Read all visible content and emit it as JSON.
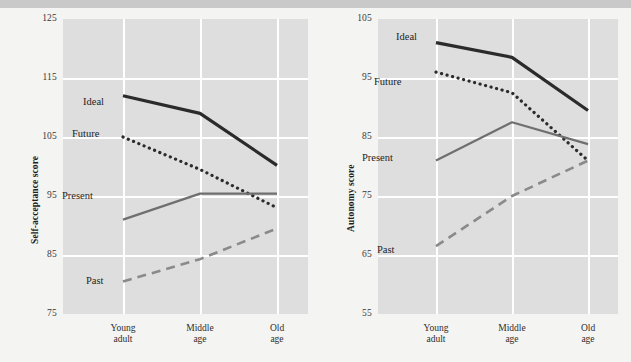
{
  "figure": {
    "background_color": "#f4f4f2",
    "plot_background_color": "#dedede",
    "gridline_color": "#ffffff",
    "line_color": "#2b2b2b",
    "present_line_color": "#6f6f6f",
    "past_line_color": "#8a8a8a"
  },
  "chart_data": [
    {
      "type": "line",
      "title": "",
      "xlabel": "",
      "ylabel": "Self-acceptance score",
      "categories": [
        "Young adult",
        "Middle age",
        "Old age"
      ],
      "category_lines": [
        [
          "Young",
          "adult"
        ],
        [
          "Middle",
          "age"
        ],
        [
          "Old",
          "age"
        ]
      ],
      "yticks": [
        75,
        85,
        95,
        105,
        115,
        125
      ],
      "ylim": [
        75,
        125
      ],
      "grid": true,
      "legend": "inline-labels",
      "series": [
        {
          "name": "Ideal",
          "style": "solid",
          "values": [
            112.0,
            109.0,
            100.2
          ]
        },
        {
          "name": "Future",
          "style": "dotted",
          "values": [
            105.0,
            99.5,
            93.0
          ]
        },
        {
          "name": "Present",
          "style": "solid-gray",
          "values": [
            91.0,
            95.4,
            95.4
          ]
        },
        {
          "name": "Past",
          "style": "dashed",
          "values": [
            80.5,
            84.3,
            89.5
          ]
        }
      ]
    },
    {
      "type": "line",
      "title": "",
      "xlabel": "",
      "ylabel": "Autonomy score",
      "categories": [
        "Young adult",
        "Middle age",
        "Old age"
      ],
      "category_lines": [
        [
          "Young",
          "adult"
        ],
        [
          "Middle",
          "age"
        ],
        [
          "Old",
          "age"
        ]
      ],
      "yticks": [
        55,
        65,
        75,
        85,
        95,
        105
      ],
      "ylim": [
        55,
        105
      ],
      "grid": true,
      "legend": "inline-labels",
      "series": [
        {
          "name": "Ideal",
          "style": "solid",
          "values": [
            101.0,
            98.5,
            89.5
          ]
        },
        {
          "name": "Future",
          "style": "dotted",
          "values": [
            96.0,
            92.5,
            81.0
          ]
        },
        {
          "name": "Present",
          "style": "solid-gray",
          "values": [
            81.0,
            87.5,
            83.8
          ]
        },
        {
          "name": "Past",
          "style": "dashed",
          "values": [
            66.5,
            75.0,
            81.0
          ]
        }
      ]
    }
  ],
  "panels": [
    {
      "id": "left",
      "ylabel": "Self-acceptance score",
      "yticks": [
        "125",
        "115",
        "105",
        "95",
        "85",
        "75"
      ],
      "series_labels": [
        "Ideal",
        "Future",
        "Present",
        "Past"
      ],
      "xticks_line1": [
        "Young",
        "Middle",
        "Old"
      ],
      "xticks_line2": [
        "adult",
        "age",
        "age"
      ]
    },
    {
      "id": "right",
      "ylabel": "Autonomy score",
      "yticks": [
        "105",
        "95",
        "85",
        "75",
        "65",
        "55"
      ],
      "series_labels": [
        "Ideal",
        "Future",
        "Present",
        "Past"
      ],
      "xticks_line1": [
        "Young",
        "Middle",
        "Old"
      ],
      "xticks_line2": [
        "adult",
        "age",
        "age"
      ]
    }
  ]
}
